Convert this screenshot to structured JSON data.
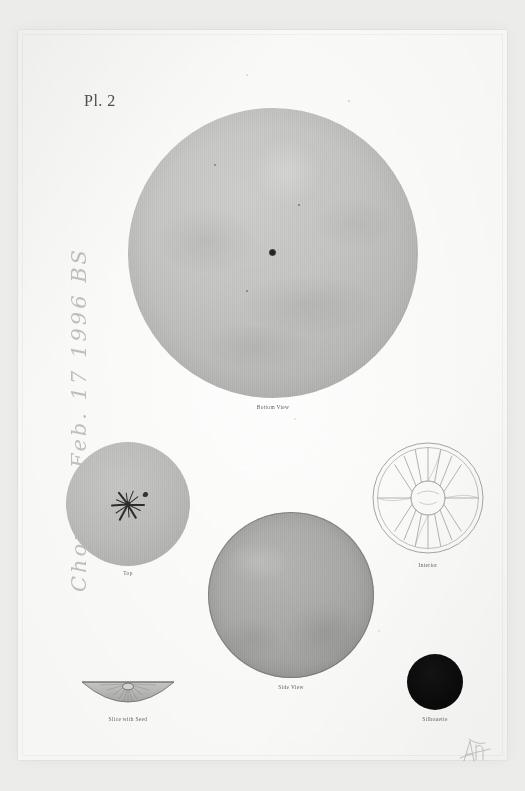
{
  "plate": {
    "label": "Pl. 2"
  },
  "inscription": {
    "text": "Chorus - Feb. 17  1996  BS"
  },
  "figures": [
    {
      "id": "bottom-view",
      "caption": "Bottom View",
      "shape": "circle",
      "tone": "#c2c2c0",
      "detail": "blossom-end scar at centre"
    },
    {
      "id": "top",
      "caption": "Top",
      "shape": "circle",
      "tone": "#bcbcba",
      "detail": "stellate calyx scar"
    },
    {
      "id": "interior",
      "caption": "Interior",
      "shape": "radial-section",
      "tone": "#f7f7f6",
      "segments": 16,
      "detail": "line drawing of cross-section"
    },
    {
      "id": "side-view",
      "caption": "Side View",
      "shape": "circle",
      "tone": "#a7a7a5",
      "detail": "outlined sphere"
    },
    {
      "id": "slice-with-seed",
      "caption": "Slice with Seed",
      "shape": "half-dome",
      "tone": "#b9b9b7",
      "detail": "radial striations with seed"
    },
    {
      "id": "silhouette",
      "caption": "Silhouette",
      "shape": "circle",
      "tone": "#0b0b0b",
      "detail": "solid black disc"
    }
  ],
  "colors": {
    "mount": "#ececeb",
    "paper": "#fbfbfa",
    "caption_text": "#5e5e5e",
    "plate_text": "#4c4c4c",
    "pencil": "rgba(110,110,112,.42)",
    "silhouette_fill": "#0b0b0b"
  }
}
